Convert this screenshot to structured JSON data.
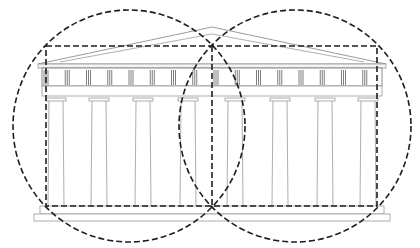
{
  "diagram": {
    "colors": {
      "background": "#ffffff",
      "building_line": "#9a9a9a",
      "building_dark": "#6f6f6f",
      "overlay": "#1e1e1e"
    },
    "overlay": {
      "rectangle": {
        "x": 46,
        "y": 46,
        "width": 331,
        "height": 160
      },
      "midline_x": 212,
      "circles": [
        {
          "cx": 129,
          "cy": 126,
          "r": 116
        },
        {
          "cx": 295,
          "cy": 126,
          "r": 116
        }
      ]
    },
    "building": {
      "pediment": {
        "left": 38,
        "right": 386,
        "apex_x": 212,
        "apex_y": 27,
        "base_y": 64
      },
      "entablature": {
        "x": 38,
        "y": 64,
        "width": 348,
        "height": 32
      },
      "triglyph_count": 16,
      "columns_x": [
        56,
        99,
        143,
        188,
        235,
        280,
        325,
        368
      ],
      "column_top_y": 98,
      "column_bottom_y": 206,
      "stylobate": [
        {
          "x": 40,
          "y": 206,
          "width": 344,
          "height": 8
        },
        {
          "x": 34,
          "y": 214,
          "width": 356,
          "height": 7
        }
      ]
    }
  }
}
